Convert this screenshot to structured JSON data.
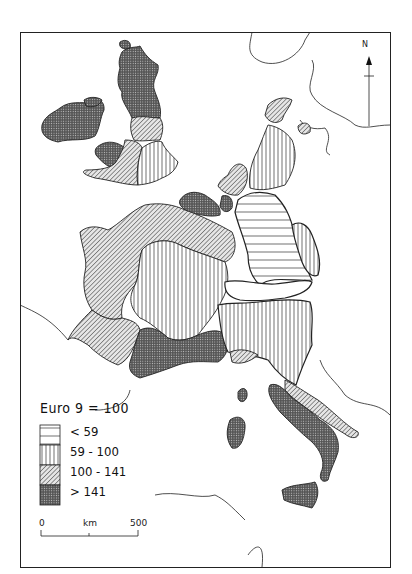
{
  "map": {
    "title": "Euro 9 = 100",
    "region": "Western Europe (EC-9 regions)",
    "colors": {
      "ink": "#1a1a1a",
      "background": "#ffffff"
    }
  },
  "legend": {
    "title": "Euro 9 = 100",
    "classes": [
      {
        "label": "< 59",
        "pattern": "horizontal-lines"
      },
      {
        "label": "59 - 100",
        "pattern": "vertical-lines"
      },
      {
        "label": "100 - 141",
        "pattern": "diagonal-hatch"
      },
      {
        "label": "> 141",
        "pattern": "dense-crosshatch"
      }
    ]
  },
  "scale_bar": {
    "start": "0",
    "unit": "km",
    "end": "500"
  },
  "north_arrow": {
    "label": "N"
  }
}
